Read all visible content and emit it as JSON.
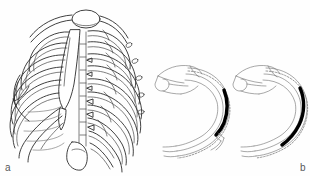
{
  "figure": {
    "background_color": "#fefefe",
    "ink_color": "#2b2b2b",
    "accent_color": "#000000",
    "dash_color": "#7a7a7a",
    "width": 310,
    "height": 176,
    "panels": [
      {
        "id": "a",
        "label": "a",
        "caption_label": "a",
        "subject": "human-rib-cage-anterior-oblique",
        "structures": [
          "clavicle",
          "manubrium",
          "sternum-body",
          "xiphoid-process",
          "true-ribs",
          "false-ribs",
          "costal-cartilage",
          "scapula",
          "thoracic-vertebrae"
        ],
        "rib_pair_count": 12
      },
      {
        "id": "b",
        "label": "b",
        "caption_label": "b",
        "subject": "rib-transverse-superior-view-pair",
        "diagrams": [
          {
            "id": "b-left",
            "name": "rib-section-displaced",
            "structures": [
              "thoracic-vertebra",
              "spinous-process",
              "transverse-process",
              "rib-shaft",
              "costal-groove-dashed-guide",
              "fracture-segment"
            ],
            "fracture_segment_color": "#000000",
            "guide_line_style": "dashed",
            "gap_present": true
          },
          {
            "id": "b-right",
            "name": "rib-section-reduced",
            "structures": [
              "thoracic-vertebra",
              "spinous-process",
              "transverse-process",
              "rib-shaft",
              "costal-groove-dashed-guide",
              "fracture-segment"
            ],
            "fracture_segment_color": "#000000",
            "guide_line_style": "dashed",
            "gap_present": false
          }
        ]
      }
    ]
  }
}
